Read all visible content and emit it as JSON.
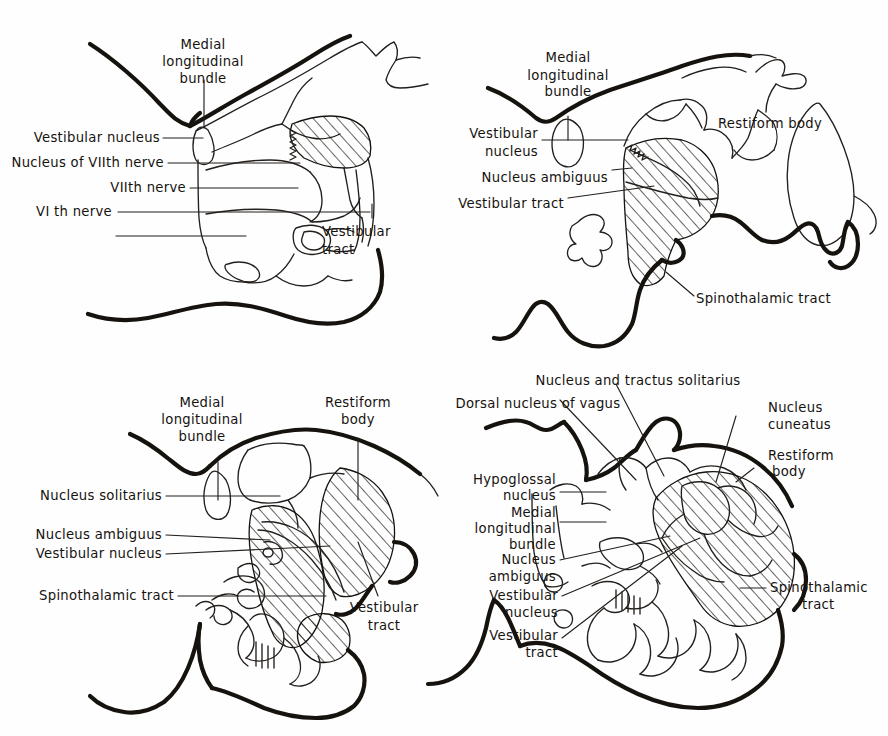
{
  "figure": {
    "background_color": "#fefefe",
    "ink_color": "#16130f",
    "panel_count": 4,
    "hatch_legend": "diagonal hatching marks affected tracts and nuclei"
  },
  "panels": [
    {
      "id": "upper-pons",
      "position": "top-left",
      "labels": [
        {
          "key": "mlb",
          "text_lines": [
            "Medial",
            "longitudinal",
            "bundle"
          ],
          "align": "middle"
        },
        {
          "key": "vest_nuc",
          "text_lines": [
            "Vestibular nucleus"
          ],
          "align": "end"
        },
        {
          "key": "nuc7",
          "text_lines": [
            "Nucleus of VIIth nerve"
          ],
          "align": "end"
        },
        {
          "key": "n7",
          "text_lines": [
            "VIIth nerve"
          ],
          "align": "end"
        },
        {
          "key": "n6",
          "text_lines": [
            "VI th nerve"
          ],
          "align": "end"
        },
        {
          "key": "vest_tract",
          "text_lines": [
            "Vestibular",
            "tract"
          ],
          "align": "start"
        }
      ]
    },
    {
      "id": "mid-medulla-upper",
      "position": "top-right",
      "labels": [
        {
          "key": "mlb",
          "text_lines": [
            "Medial",
            "longitudinal",
            "bundle"
          ],
          "align": "middle"
        },
        {
          "key": "vest_nuc",
          "text_lines": [
            "Vestibular",
            "nucleus"
          ],
          "align": "end"
        },
        {
          "key": "nuc_amb",
          "text_lines": [
            "Nucleus ambiguus"
          ],
          "align": "end"
        },
        {
          "key": "vest_tract",
          "text_lines": [
            "Vestibular tract"
          ],
          "align": "end"
        },
        {
          "key": "restiform",
          "text_lines": [
            "Restiform body"
          ],
          "align": "start"
        },
        {
          "key": "spinothalamic",
          "text_lines": [
            "Spinothalamic tract"
          ],
          "align": "start"
        }
      ]
    },
    {
      "id": "medulla-mid",
      "position": "bottom-left",
      "labels": [
        {
          "key": "mlb",
          "text_lines": [
            "Medial",
            "longitudinal",
            "bundle"
          ],
          "align": "middle"
        },
        {
          "key": "restiform",
          "text_lines": [
            "Restiform",
            "body"
          ],
          "align": "middle"
        },
        {
          "key": "nuc_sol",
          "text_lines": [
            "Nucleus solitarius"
          ],
          "align": "end"
        },
        {
          "key": "nuc_amb",
          "text_lines": [
            "Nucleus ambiguus"
          ],
          "align": "end"
        },
        {
          "key": "vest_nuc",
          "text_lines": [
            "Vestibular nucleus"
          ],
          "align": "end"
        },
        {
          "key": "spinothalamic",
          "text_lines": [
            "Spinothalamic tract"
          ],
          "align": "end"
        },
        {
          "key": "vest_tract",
          "text_lines": [
            "Vestibular",
            "tract"
          ],
          "align": "middle"
        }
      ]
    },
    {
      "id": "lower-medulla",
      "position": "bottom-right",
      "labels": [
        {
          "key": "nuc_tract_sol",
          "text_lines": [
            "Nucleus and tractus solitarius"
          ],
          "align": "middle"
        },
        {
          "key": "dorsal_vagus",
          "text_lines": [
            "Dorsal nucleus of vagus"
          ],
          "align": "middle"
        },
        {
          "key": "hypoglossal",
          "text_lines": [
            "Hypoglossal",
            "nucleus"
          ],
          "align": "end"
        },
        {
          "key": "mlb",
          "text_lines": [
            "Medial",
            "longitudinal",
            "bundle"
          ],
          "align": "end"
        },
        {
          "key": "nuc_amb",
          "text_lines": [
            "Nucleus",
            "ambiguus"
          ],
          "align": "end"
        },
        {
          "key": "vest_nuc",
          "text_lines": [
            "Vestibular",
            "nucleus"
          ],
          "align": "end"
        },
        {
          "key": "vest_tract",
          "text_lines": [
            "Vestibular",
            "tract"
          ],
          "align": "end"
        },
        {
          "key": "nuc_cuneatus",
          "text_lines": [
            "Nucleus",
            "cuneatus"
          ],
          "align": "start"
        },
        {
          "key": "restiform",
          "text_lines": [
            "Restiform",
            "body"
          ],
          "align": "start"
        },
        {
          "key": "spinothalamic",
          "text_lines": [
            "Spinothalamic",
            "tract"
          ],
          "align": "start"
        }
      ]
    }
  ],
  "text": {
    "medial": "Medial",
    "longitudinal": "longitudinal",
    "bundle": "bundle",
    "vestibular_nucleus": "Vestibular nucleus",
    "vestibular": "Vestibular",
    "nucleus": "nucleus",
    "nucleus_of_viith_nerve": "Nucleus of VIIth nerve",
    "viith_nerve": "VIIth nerve",
    "vith_nerve": "VI th nerve",
    "vestibular_tract_l1": "Vestibular",
    "vestibular_tract_l2": "tract",
    "vestibular_tract": "Vestibular tract",
    "nucleus_ambiguus": "Nucleus ambiguus",
    "nucleus_w": "Nucleus",
    "ambiguus": "ambiguus",
    "restiform_body": "Restiform body",
    "restiform": "Restiform",
    "body": "body",
    "spinothalamic_tract": "Spinothalamic tract",
    "spinothalamic": "Spinothalamic",
    "tract": "tract",
    "nucleus_solitarius": "Nucleus solitarius",
    "nucleus_and_tractus_solitarius": "Nucleus and tractus solitarius",
    "dorsal_nucleus_of_vagus": "Dorsal nucleus of vagus",
    "hypoglossal": "Hypoglossal",
    "nucleus_cuneatus_l1": "Nucleus",
    "cuneatus": "cuneatus"
  }
}
